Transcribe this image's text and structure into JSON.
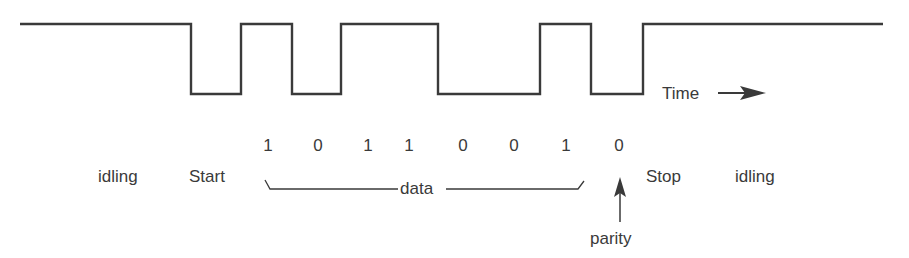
{
  "diagram": {
    "colors": {
      "ink": "#3a3a3a",
      "background": "#ffffff"
    },
    "waveform": {
      "high_y": 24,
      "low_y": 94,
      "points": [
        [
          20,
          24
        ],
        [
          191,
          24
        ],
        [
          191,
          94
        ],
        [
          241,
          94
        ],
        [
          241,
          24
        ],
        [
          292,
          24
        ],
        [
          292,
          94
        ],
        [
          341,
          94
        ],
        [
          341,
          24
        ],
        [
          438,
          24
        ],
        [
          438,
          94
        ],
        [
          540,
          94
        ],
        [
          540,
          24
        ],
        [
          591,
          24
        ],
        [
          591,
          94
        ],
        [
          643,
          94
        ],
        [
          643,
          24
        ],
        [
          883,
          24
        ]
      ]
    },
    "time_axis": {
      "label": "Time",
      "arrow_icon": "right-arrow-icon"
    },
    "bits": {
      "values": [
        "1",
        "0",
        "1",
        "1",
        "0",
        "0",
        "1",
        "0"
      ],
      "x_positions": [
        268,
        318,
        368,
        409,
        463,
        514,
        566,
        619
      ]
    },
    "labels": {
      "idling_left": "idling",
      "start": "Start",
      "data": "data",
      "stop": "Stop",
      "idling_right": "idling",
      "parity": "parity"
    },
    "parity_pointer": {
      "icon": "up-arrow-icon"
    }
  }
}
